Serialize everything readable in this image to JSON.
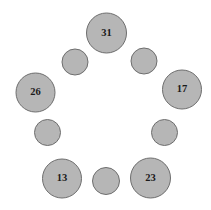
{
  "diagram": {
    "type": "node-ring",
    "canvas": {
      "width": 211,
      "height": 210,
      "background": "#ffffff"
    },
    "style": {
      "node_fill": "#b6b6b6",
      "node_stroke": "#6e6e6e",
      "label_color": "#1a1a1a",
      "label_font_size": 10.5
    },
    "nodes": [
      {
        "id": "n1",
        "label": "31",
        "labeled": true,
        "size": "large",
        "cx": 106.5,
        "cy": 33.0,
        "r": 20.0
      },
      {
        "id": "n2",
        "label": "",
        "labeled": false,
        "size": "small",
        "cx": 144.0,
        "cy": 61.0,
        "r": 13.0
      },
      {
        "id": "n3",
        "label": "17",
        "labeled": true,
        "size": "large",
        "cx": 182.0,
        "cy": 89.5,
        "r": 19.5
      },
      {
        "id": "n4",
        "label": "",
        "labeled": false,
        "size": "small",
        "cx": 164.5,
        "cy": 132.5,
        "r": 13.0
      },
      {
        "id": "n5",
        "label": "23",
        "labeled": true,
        "size": "large",
        "cx": 150.5,
        "cy": 178.0,
        "r": 20.0
      },
      {
        "id": "n6",
        "label": "",
        "labeled": false,
        "size": "small",
        "cx": 106.0,
        "cy": 181.0,
        "r": 13.5
      },
      {
        "id": "n7",
        "label": "13",
        "labeled": true,
        "size": "large",
        "cx": 62.0,
        "cy": 178.5,
        "r": 19.5
      },
      {
        "id": "n8",
        "label": "",
        "labeled": false,
        "size": "small",
        "cx": 47.5,
        "cy": 132.5,
        "r": 13.0
      },
      {
        "id": "n9",
        "label": "26",
        "labeled": true,
        "size": "large",
        "cx": 35.5,
        "cy": 92.5,
        "r": 19.5
      },
      {
        "id": "n10",
        "label": "",
        "labeled": false,
        "size": "small",
        "cx": 75.0,
        "cy": 62.0,
        "r": 13.0
      }
    ],
    "visible_labels": [
      "31",
      "17",
      "23",
      "13",
      "26"
    ]
  }
}
